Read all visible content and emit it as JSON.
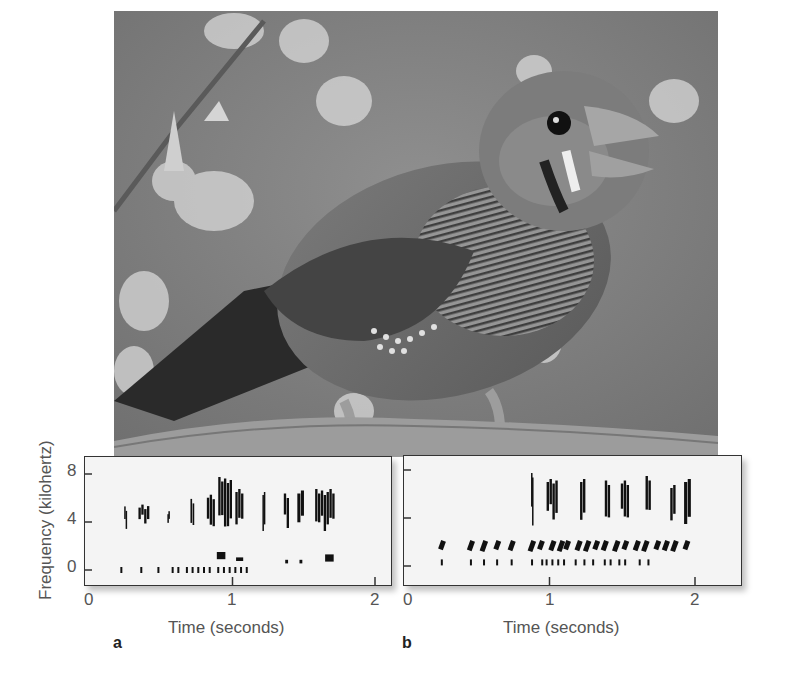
{
  "chart_data": [
    {
      "type": "heatmap",
      "panel_label": "a",
      "title": "",
      "xlabel": "Time (seconds)",
      "ylabel": "Frequency (kilohertz)",
      "x_ticks": [
        "0",
        "1",
        "2"
      ],
      "y_ticks": [
        "0",
        "4",
        "8"
      ],
      "xlim": [
        0,
        2.1
      ],
      "ylim": [
        -1.5,
        9
      ],
      "description": "Sound spectrogram of song; dense energy at 4-8 kHz between 0.7 and 1.75 s, harmonic dots near 0-1 kHz",
      "blobs": [
        {
          "t": 0.25,
          "f": 4.3,
          "w": 0.02,
          "h": 1.5
        },
        {
          "t": 0.38,
          "f": 4.6,
          "w": 0.08,
          "h": 1.2
        },
        {
          "t": 0.55,
          "f": 4.5,
          "w": 0.01,
          "h": 0.8
        },
        {
          "t": 0.72,
          "f": 4.8,
          "w": 0.03,
          "h": 2.0
        },
        {
          "t": 0.85,
          "f": 4.9,
          "w": 0.06,
          "h": 2.5
        },
        {
          "t": 0.95,
          "f": 5.5,
          "w": 0.1,
          "h": 4.0
        },
        {
          "t": 1.05,
          "f": 5.0,
          "w": 0.06,
          "h": 3.0
        },
        {
          "t": 1.22,
          "f": 5.0,
          "w": 0.02,
          "h": 3.0
        },
        {
          "t": 1.38,
          "f": 5.0,
          "w": 0.04,
          "h": 2.5
        },
        {
          "t": 1.48,
          "f": 5.0,
          "w": 0.05,
          "h": 3.0
        },
        {
          "t": 1.65,
          "f": 5.0,
          "w": 0.14,
          "h": 3.0
        }
      ],
      "low_marks": {
        "f": 0,
        "times": [
          0.22,
          0.36,
          0.48,
          0.58,
          0.62,
          0.68,
          0.72,
          0.76,
          0.8,
          0.84,
          0.9,
          0.94,
          0.98,
          1.02,
          1.06,
          1.1
        ]
      },
      "mid_marks": [
        {
          "t": 0.92,
          "f": 1.2,
          "w": 0.06,
          "h": 0.6
        },
        {
          "t": 1.05,
          "f": 0.9,
          "w": 0.05,
          "h": 0.3
        },
        {
          "t": 1.38,
          "f": 0.7,
          "w": 0.02,
          "h": 0.3
        },
        {
          "t": 1.48,
          "f": 0.7,
          "w": 0.02,
          "h": 0.3
        },
        {
          "t": 1.68,
          "f": 1.0,
          "w": 0.06,
          "h": 0.6
        }
      ]
    },
    {
      "type": "heatmap",
      "panel_label": "b",
      "title": "",
      "xlabel": "Time (seconds)",
      "ylabel": "",
      "x_ticks": [
        "0",
        "1",
        "2"
      ],
      "y_ticks": [
        "0",
        "4",
        "8"
      ],
      "xlim": [
        0,
        2.4
      ],
      "ylim": [
        -1.5,
        9
      ],
      "description": "Sound spectrogram; repeated syllables at ~1.5-2 kHz from 0.3 s, tall 4-8 kHz bursts between 0.9 and 2 s",
      "blobs": [
        {
          "t": 0.88,
          "f": 5.5,
          "w": 0.01,
          "h": 4.0
        },
        {
          "t": 1.02,
          "f": 5.5,
          "w": 0.08,
          "h": 3.0
        },
        {
          "t": 1.23,
          "f": 5.5,
          "w": 0.04,
          "h": 3.5
        },
        {
          "t": 1.4,
          "f": 5.5,
          "w": 0.04,
          "h": 3.0
        },
        {
          "t": 1.52,
          "f": 5.5,
          "w": 0.06,
          "h": 3.0
        },
        {
          "t": 1.68,
          "f": 5.5,
          "w": 0.04,
          "h": 3.5
        },
        {
          "t": 1.85,
          "f": 5.0,
          "w": 0.04,
          "h": 3.0
        },
        {
          "t": 1.95,
          "f": 5.5,
          "w": 0.05,
          "h": 3.5
        }
      ],
      "syllable_marks": {
        "f": 1.7,
        "times": [
          0.26,
          0.46,
          0.55,
          0.64,
          0.74,
          0.88,
          0.94,
          1.02,
          1.08,
          1.12,
          1.2,
          1.26,
          1.32,
          1.38,
          1.46,
          1.52,
          1.6,
          1.66,
          1.74,
          1.8,
          1.86,
          1.94
        ]
      },
      "low_marks": {
        "f": 0.3,
        "times": [
          0.26,
          0.46,
          0.55,
          0.64,
          0.74,
          0.88,
          0.95,
          0.98,
          1.02,
          1.06,
          1.1,
          1.18,
          1.24,
          1.3,
          1.38,
          1.42,
          1.48,
          1.52,
          1.62,
          1.68
        ]
      }
    }
  ],
  "figure": {
    "ylabel": "Frequency (kilohertz)",
    "panels": [
      {
        "label": "a",
        "xlabel": "Time (seconds)",
        "x_ticks": [
          "0",
          "1",
          "2"
        ],
        "y_ticks": [
          "8",
          "4",
          "0"
        ]
      },
      {
        "label": "b",
        "xlabel": "Time (seconds)",
        "x_ticks": [
          "0",
          "1",
          "2"
        ]
      }
    ],
    "photo_subject": "finch perched on branch"
  }
}
